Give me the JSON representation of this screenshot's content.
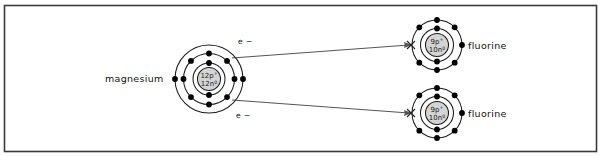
{
  "figure": {
    "background_color": "#ffffff",
    "border_color": "#3a3a3a",
    "line_color": "#4a4a4a",
    "shell_color": "#1a1a1a",
    "electron_color": "#000000",
    "nucleus_fill": "#d4d4d4"
  },
  "atoms": {
    "magnesium": {
      "label": "magnesium",
      "nucleus_protons": "12p",
      "nucleus_protons_charge": "+",
      "nucleus_neutrons": "12n",
      "nucleus_neutrons_charge": "0",
      "shell_counts": [
        2,
        8,
        2
      ],
      "center_x": 209,
      "center_y": 79,
      "shell_radii": [
        16,
        25.5,
        34
      ],
      "nucleus_radius": 11.5
    },
    "fluorine_top": {
      "label": "fluorine",
      "nucleus_protons": "9p",
      "nucleus_protons_charge": "+",
      "nucleus_neutrons": "10n",
      "nucleus_neutrons_charge": "0",
      "shell_counts": [
        2,
        7
      ],
      "center_x": 437,
      "center_y": 45,
      "shell_radii": [
        16.5,
        25
      ],
      "nucleus_radius": 11.5
    },
    "fluorine_bottom": {
      "label": "fluorine",
      "nucleus_protons": "9p",
      "nucleus_protons_charge": "+",
      "nucleus_neutrons": "10n",
      "nucleus_neutrons_charge": "0",
      "shell_counts": [
        2,
        7
      ],
      "center_x": 437,
      "center_y": 113,
      "shell_radii": [
        16.5,
        25
      ],
      "nucleus_radius": 11.5
    }
  },
  "transfers": {
    "top_arrow_label": "e −",
    "bottom_arrow_label": "e −"
  },
  "chart_data": {
    "type": "diagram",
    "nodes": [
      {
        "name": "magnesium",
        "protons": 12,
        "neutrons": 12,
        "shells": [
          2,
          8,
          2
        ],
        "valence_electrons": 2
      },
      {
        "name": "fluorine",
        "protons": 9,
        "neutrons": 10,
        "shells": [
          2,
          7
        ],
        "valence_electrons": 7
      },
      {
        "name": "fluorine",
        "protons": 9,
        "neutrons": 10,
        "shells": [
          2,
          7
        ],
        "valence_electrons": 7
      }
    ],
    "edges": [
      {
        "from": "magnesium",
        "to": "fluorine_top",
        "label": "e −",
        "transferred": 1
      },
      {
        "from": "magnesium",
        "to": "fluorine_bottom",
        "label": "e −",
        "transferred": 1
      }
    ]
  }
}
